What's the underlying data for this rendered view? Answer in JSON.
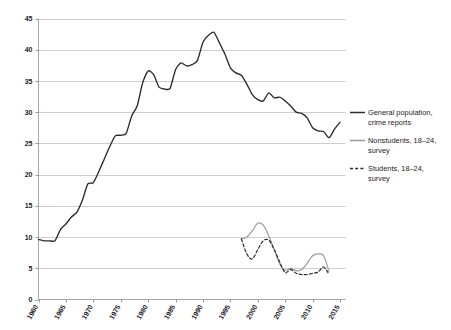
{
  "chart_data": {
    "type": "line",
    "title": "",
    "subtitle": "",
    "xlabel": "",
    "ylabel": "",
    "xlim": [
      1960,
      2016
    ],
    "ylim": [
      0,
      45
    ],
    "ytick_labels": [
      "0",
      "5",
      "10",
      "15",
      "20",
      "25",
      "30",
      "35",
      "40",
      "45"
    ],
    "ytick_values": [
      0,
      5,
      10,
      15,
      20,
      25,
      30,
      35,
      40,
      45
    ],
    "xtick_labels": [
      "1960",
      "1965",
      "1970",
      "1975",
      "1980",
      "1985",
      "1990",
      "1995",
      "2000",
      "2005",
      "2010",
      "2015"
    ],
    "xtick_values": [
      1960,
      1965,
      1970,
      1975,
      1980,
      1985,
      1990,
      1995,
      2000,
      2005,
      2010,
      2015
    ],
    "grid": "horizontal",
    "legend_position": "right",
    "colors": {
      "general": "#2b2b2b",
      "nonstudents": "#9a9a9a",
      "students": "#2b2b2b",
      "gridline": "#b9b9b9",
      "axis": "#8f8f8f",
      "background": "#ffffff"
    },
    "series": [
      {
        "name": "General population, crime reports",
        "legend_label_line1": "General population,",
        "legend_label_line2": "crime reports",
        "style": "solid",
        "color": "#2b2b2b",
        "x": [
          1960,
          1961,
          1962,
          1963,
          1964,
          1965,
          1966,
          1967,
          1968,
          1969,
          1970,
          1971,
          1972,
          1973,
          1974,
          1975,
          1976,
          1977,
          1978,
          1979,
          1980,
          1981,
          1982,
          1983,
          1984,
          1985,
          1986,
          1987,
          1988,
          1989,
          1990,
          1991,
          1992,
          1993,
          1994,
          1995,
          1996,
          1997,
          1998,
          1999,
          2000,
          2001,
          2002,
          2003,
          2004,
          2005,
          2006,
          2007,
          2008,
          2009,
          2010,
          2011,
          2012,
          2013,
          2014,
          2015
        ],
        "y": [
          9.6,
          9.4,
          9.4,
          9.4,
          11.2,
          12.1,
          13.2,
          14.0,
          15.9,
          18.5,
          18.7,
          20.5,
          22.5,
          24.5,
          26.2,
          26.3,
          26.6,
          29.4,
          31.0,
          34.7,
          36.6,
          36.0,
          34.0,
          33.7,
          33.8,
          36.8,
          37.9,
          37.4,
          37.6,
          38.3,
          41.2,
          42.3,
          42.8,
          41.1,
          39.3,
          37.1,
          36.3,
          35.9,
          34.5,
          32.8,
          32.0,
          31.8,
          33.1,
          32.3,
          32.4,
          31.8,
          31.0,
          30.0,
          29.8,
          29.1,
          27.5,
          27.0,
          26.9,
          25.9,
          27.3,
          28.4
        ]
      },
      {
        "name": "Nonstudents, 18-24, survey",
        "legend_label_line1": "Nonstudents, 18–24,",
        "legend_label_line2": "survey",
        "style": "solid",
        "color": "#9a9a9a",
        "x": [
          1997,
          1998,
          1999,
          2000,
          2001,
          2002,
          2003,
          2004,
          2005,
          2006,
          2007,
          2008,
          2009,
          2010,
          2011,
          2012,
          2013
        ],
        "y": [
          9.7,
          10.0,
          11.0,
          12.2,
          11.9,
          10.2,
          8.0,
          5.7,
          4.7,
          5.0,
          4.6,
          4.8,
          5.8,
          7.0,
          7.3,
          7.0,
          4.5
        ]
      },
      {
        "name": "Students, 18-24, survey",
        "legend_label_line1": "Students, 18–24,",
        "legend_label_line2": "survey",
        "style": "dashed",
        "color": "#2b2b2b",
        "x": [
          1997,
          1998,
          1999,
          2000,
          2001,
          2002,
          2003,
          2004,
          2005,
          2006,
          2007,
          2008,
          2009,
          2010,
          2011,
          2012,
          2013
        ],
        "y": [
          9.7,
          7.3,
          6.5,
          8.0,
          9.4,
          9.5,
          8.0,
          6.0,
          4.3,
          4.8,
          4.2,
          4.0,
          4.0,
          4.2,
          4.4,
          5.2,
          4.0
        ]
      }
    ]
  },
  "legend": {
    "entries": [
      {
        "swatch": "solid-dark-line-swatch",
        "line1": "General population,",
        "line2": "crime reports"
      },
      {
        "swatch": "solid-gray-line-swatch",
        "line1": "Nonstudents, 18–24,",
        "line2": "survey"
      },
      {
        "swatch": "dashed-dark-line-swatch",
        "line1": "Students, 18–24,",
        "line2": "survey"
      }
    ]
  }
}
